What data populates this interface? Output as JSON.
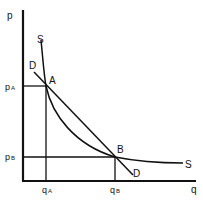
{
  "diagram": {
    "type": "supply-demand",
    "axes": {
      "y_label": "p",
      "x_label": "q"
    },
    "curves": [
      {
        "name": "supply",
        "label": "S",
        "shape": "convex curve, steep at top, flattening to the right"
      },
      {
        "name": "demand",
        "label": "D",
        "shape": "straight downward-sloping line"
      }
    ],
    "points": [
      {
        "label": "A",
        "price_label": "p",
        "price_sub": "A",
        "quantity_label": "q",
        "quantity_sub": "A"
      },
      {
        "label": "B",
        "price_label": "p",
        "price_sub": "B",
        "quantity_label": "q",
        "quantity_sub": "B"
      }
    ],
    "labels": {
      "S_top": "S",
      "S_right": "S",
      "D_top": "D",
      "D_bottom": "D",
      "A": "A",
      "B": "B",
      "pA_main": "p",
      "pA_sub": "A",
      "pB_main": "p",
      "pB_sub": "B",
      "qA_main": "q",
      "qA_sub": "A",
      "qB_main": "q",
      "qB_sub": "B",
      "p_axis": "p",
      "q_axis": "q"
    },
    "colors": {
      "ink": "#111111",
      "background": "#ffffff"
    }
  }
}
